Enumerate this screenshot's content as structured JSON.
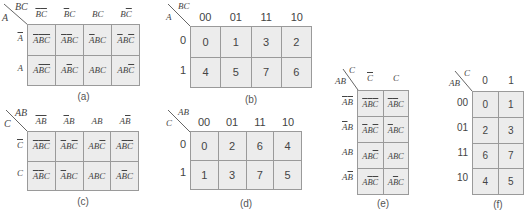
{
  "panels": {
    "a": {
      "caption": "(a)",
      "corner_top": "BC",
      "corner_left": "A",
      "col_headers": [
        "~B~C",
        "~BC",
        "BC",
        "B~C"
      ],
      "row_headers": [
        "~A",
        "A"
      ],
      "cells": [
        [
          "~A~B~C",
          "~A~BC",
          "~ABC",
          "~AB~C"
        ],
        [
          "A~B~C",
          "A~BC",
          "ABC",
          "AB~C"
        ]
      ]
    },
    "b": {
      "caption": "(b)",
      "corner_top": "BC",
      "corner_left": "A",
      "col_headers": [
        "00",
        "01",
        "11",
        "10"
      ],
      "row_headers": [
        "0",
        "1"
      ],
      "cells": [
        [
          "0",
          "1",
          "3",
          "2"
        ],
        [
          "4",
          "5",
          "7",
          "6"
        ]
      ]
    },
    "c": {
      "caption": "(c)",
      "corner_top": "AB",
      "corner_left": "C",
      "col_headers": [
        "~A~B",
        "~AB",
        "AB",
        "A~B"
      ],
      "row_headers": [
        "~C",
        "C"
      ],
      "cells": [
        [
          "~A~B~C",
          "~AB~C",
          "AB~C",
          "A~B~C"
        ],
        [
          "~A~BC",
          "~ABC",
          "ABC",
          "A~BC"
        ]
      ]
    },
    "d": {
      "caption": "(d)",
      "corner_top": "AB",
      "corner_left": "C",
      "col_headers": [
        "00",
        "01",
        "11",
        "10"
      ],
      "row_headers": [
        "0",
        "1"
      ],
      "cells": [
        [
          "0",
          "2",
          "6",
          "4"
        ],
        [
          "1",
          "3",
          "7",
          "5"
        ]
      ]
    },
    "e": {
      "caption": "(e)",
      "corner_top": "C",
      "corner_left": "AB",
      "col_headers": [
        "~C",
        "C"
      ],
      "row_headers": [
        "~A~B",
        "~AB",
        "AB",
        "A~B"
      ],
      "cells": [
        [
          "~A~B~C",
          "~A~BC"
        ],
        [
          "~AB~C",
          "~ABC"
        ],
        [
          "AB~C",
          "ABC"
        ],
        [
          "A~B~C",
          "A~BC"
        ]
      ]
    },
    "f": {
      "caption": "(f)",
      "corner_top": "C",
      "corner_left": "AB",
      "col_headers": [
        "0",
        "1"
      ],
      "row_headers": [
        "00",
        "01",
        "11",
        "10"
      ],
      "cells": [
        [
          "0",
          "1"
        ],
        [
          "2",
          "3"
        ],
        [
          "6",
          "7"
        ],
        [
          "4",
          "5"
        ]
      ]
    }
  },
  "colors": {
    "cell_fill": "#ececec",
    "grid_line": "#9a9a9a",
    "text": "#444444"
  }
}
